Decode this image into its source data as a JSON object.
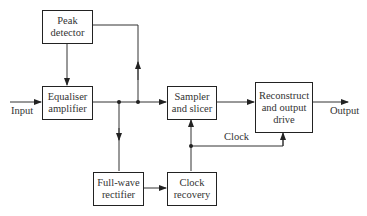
{
  "diagram": {
    "type": "block-diagram",
    "blocks": {
      "peak_detector": {
        "line1": "Peak",
        "line2": "detector"
      },
      "equaliser": {
        "line1": "Equaliser",
        "line2": "amplifier"
      },
      "sampler": {
        "line1": "Sampler",
        "line2": "and slicer"
      },
      "reconstruct": {
        "line1": "Reconstruct",
        "line2": "and output",
        "line3": "drive"
      },
      "rectifier": {
        "line1": "Full-wave",
        "line2": "rectifier"
      },
      "clock_recovery": {
        "line1": "Clock",
        "line2": "recovery"
      }
    },
    "labels": {
      "input": "Input",
      "output": "Output",
      "clock": "Clock"
    },
    "connections": [
      {
        "from": "Input",
        "to": "Equaliser amplifier"
      },
      {
        "from": "Peak detector",
        "to": "Equaliser amplifier"
      },
      {
        "from": "Equaliser amplifier",
        "to": "Sampler and slicer"
      },
      {
        "from": "Equaliser amplifier",
        "to": "Full-wave rectifier"
      },
      {
        "from": "Peak detector",
        "to": "Equaliser output junction"
      },
      {
        "from": "Full-wave rectifier",
        "to": "Clock recovery"
      },
      {
        "from": "Clock recovery",
        "to": "Sampler and slicer"
      },
      {
        "from": "Clock recovery",
        "to": "Reconstruct and output drive",
        "label": "Clock"
      },
      {
        "from": "Sampler and slicer",
        "to": "Reconstruct and output drive"
      },
      {
        "from": "Reconstruct and output drive",
        "to": "Output"
      }
    ]
  }
}
